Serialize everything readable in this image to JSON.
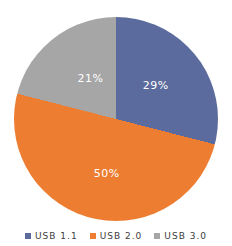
{
  "chart_data": {
    "type": "pie",
    "title": "",
    "categories": [
      "USB 1.1",
      "USB 2.0",
      "USB 3.0"
    ],
    "values": [
      29,
      50,
      21
    ],
    "slices": [
      {
        "label": "USB 1.1",
        "value": 29,
        "display": "29%",
        "color": "#5c6b9d"
      },
      {
        "label": "USB 2.0",
        "value": 50,
        "display": "50%",
        "color": "#ed7d31"
      },
      {
        "label": "USB 3.0",
        "value": 21,
        "display": "21%",
        "color": "#a6a6a6"
      }
    ],
    "start_angle_deg": 0,
    "direction": "clockwise",
    "label_color": "#ffffff",
    "legend_position": "bottom"
  },
  "legend": {
    "items": [
      {
        "label": "USB 1.1",
        "color": "#5c6b9d"
      },
      {
        "label": "USB 2.0",
        "color": "#ed7d31"
      },
      {
        "label": "USB 3.0",
        "color": "#a6a6a6"
      }
    ]
  }
}
